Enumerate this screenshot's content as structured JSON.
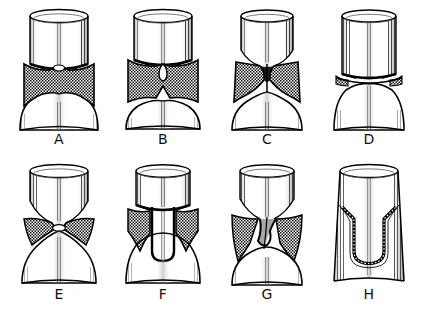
{
  "figure": {
    "background_color": "#ffffff",
    "ink_color": "#000000",
    "hatch_color": "#1a1a1a",
    "panel_count": 8,
    "rows": 2,
    "columns": 4
  },
  "panels": [
    {
      "id": "A",
      "label": "A",
      "row": 0,
      "column": 0,
      "description": "Upper cylinder rests on a broad crosshatched band; band floor arches down into a shallow flared base.",
      "top_body": "cylinder",
      "shaded_zone": "wide-band",
      "interface_shape": "shallow-arch",
      "base_shape": "flared-dome"
    },
    {
      "id": "B",
      "label": "B",
      "row": 0,
      "column": 1,
      "description": "Crosshatched band with a small teardrop void hanging from the upper interface and a central downward spike at the base.",
      "top_body": "cylinder",
      "shaded_zone": "wide-band",
      "interface_shape": "teardrop-void",
      "base_shape": "spiked-flare"
    },
    {
      "id": "C",
      "label": "C",
      "row": 0,
      "column": 2,
      "description": "Hourglass neck: the crosshatched zone pinches to a narrow waist at mid height between a tapering cup and a flared foot.",
      "top_body": "tapered-cup",
      "shaded_zone": "hourglass",
      "interface_shape": "pinched-waist",
      "base_shape": "flared-foot"
    },
    {
      "id": "D",
      "label": "D",
      "row": 0,
      "column": 3,
      "description": "Tall cylinder meeting a lower cylinder along a thin dark seam with only small crosshatched wedges at the margins.",
      "top_body": "cylinder",
      "shaded_zone": "thin-seam",
      "interface_shape": "flat-seam",
      "base_shape": "straight-flared"
    },
    {
      "id": "E",
      "label": "E",
      "row": 1,
      "column": 0,
      "description": "Tapering cup and flaring base touch at a single point; crosshatch survives only as triangular wedges at the sides.",
      "top_body": "tapered-cup",
      "shaded_zone": "corner-wedges",
      "interface_shape": "point-contact",
      "base_shape": "flared-foot"
    },
    {
      "id": "F",
      "label": "F",
      "row": 1,
      "column": 1,
      "description": "Central lobe of upper material plunges deep into the base as a U, leaving crosshatch on both flanks.",
      "top_body": "cylinder",
      "shaded_zone": "flanking-bands",
      "interface_shape": "deep-u-lobe",
      "base_shape": "flared-foot"
    },
    {
      "id": "G",
      "label": "G",
      "row": 1,
      "column": 2,
      "description": "Asymmetric funnel: a narrow neck of upper material drains obliquely through the crosshatched zone into the base.",
      "top_body": "tapered-cup",
      "shaded_zone": "asymmetric-bands",
      "interface_shape": "oblique-funnel",
      "base_shape": "flared-foot"
    },
    {
      "id": "H",
      "label": "H",
      "row": 1,
      "column": 3,
      "description": "Deep narrow U-shaped seam outlined by a thin hatched rind, with no broad crosshatched zone remaining.",
      "top_body": "cylinder",
      "shaded_zone": "thin-rind",
      "interface_shape": "deep-narrow-u",
      "base_shape": "straight-flared"
    }
  ]
}
